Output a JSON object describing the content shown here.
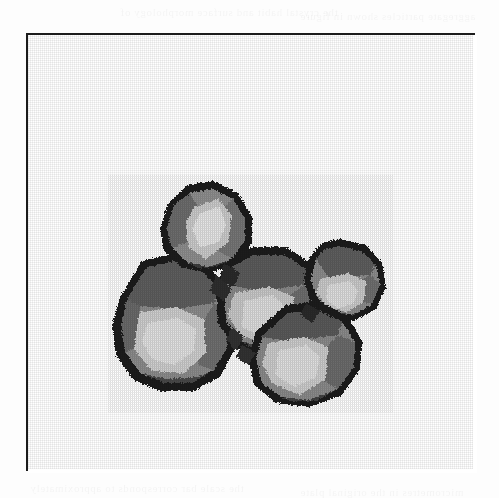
{
  "page": {
    "background_color": "#fdfdfd",
    "width": 499,
    "height": 498
  },
  "figure": {
    "frame": {
      "border_color": "#1c1c1c",
      "border_width_px": 2,
      "fill_color": "#ffffff",
      "x": 26,
      "y": 33,
      "width": 449,
      "height": 438
    },
    "subject_label": "Cluster of five faceted polyhedral crystal grains",
    "image_type": "halftone-micrograph",
    "particle_count": 5
  },
  "palette": {
    "outline_dark": "#1f1f1f",
    "shadow_dark": "#303030",
    "mid_gray": "#7b7b7b",
    "light_gray": "#a9a9a9",
    "highlight": "#d9d9d9",
    "bright_highlight": "#ececec",
    "background": "#ffffff"
  },
  "particles": [
    {
      "name": "top-crystal",
      "label": "Top polyhedron",
      "center_x": 180,
      "center_y": 188,
      "radius": 46,
      "highlight_tone": "#dcdcdc"
    },
    {
      "name": "left-crystal",
      "label": "Left large polyhedron",
      "center_x": 147,
      "center_y": 285,
      "radius": 67,
      "highlight_tone": "#dedede"
    },
    {
      "name": "center-crystal",
      "label": "Centre polyhedron",
      "center_x": 243,
      "center_y": 258,
      "radius": 57,
      "highlight_tone": "#d2d2d2"
    },
    {
      "name": "right-crystal",
      "label": "Right small polyhedron",
      "center_x": 318,
      "center_y": 241,
      "radius": 42,
      "highlight_tone": "#d4d4d4"
    },
    {
      "name": "bottom-right-crystal",
      "label": "Lower right polyhedron",
      "center_x": 281,
      "center_y": 311,
      "radius": 56,
      "highlight_tone": "#dcdcdc"
    }
  ],
  "ghost_text": {
    "note": "Illegible bleed-through text from the reverse side of the page",
    "lines": [
      {
        "text": "the crystal habit and surface morphology of",
        "x": 120,
        "y": 6
      },
      {
        "text": "aggregate particles shown in figure",
        "x": 300,
        "y": 10
      },
      {
        "text": "observed under reflected light the grains",
        "x": 40,
        "y": 158
      },
      {
        "text": "exhibit well developed facets",
        "x": 250,
        "y": 162
      },
      {
        "text": "euhedral forms are common in this",
        "x": 36,
        "y": 316
      },
      {
        "text": "sample of the recovered material",
        "x": 40,
        "y": 336
      },
      {
        "text": "the scale bar corresponds to approximately",
        "x": 30,
        "y": 482
      },
      {
        "text": "micrometres in the original plate",
        "x": 300,
        "y": 486
      }
    ]
  }
}
